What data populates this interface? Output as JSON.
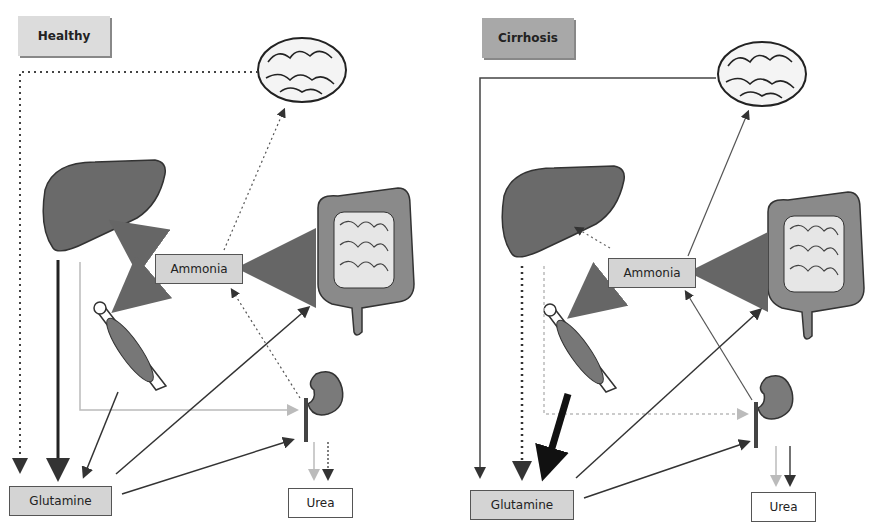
{
  "panels": {
    "healthy": {
      "title": "Healthy",
      "title_color": "#dcdcdc",
      "nodes": {
        "ammonia": "Ammonia",
        "glutamine": "Glutamine",
        "urea": "Urea"
      },
      "organs": [
        "brain",
        "liver",
        "intestine",
        "muscle",
        "kidney"
      ]
    },
    "cirrhosis": {
      "title": "Cirrhosis",
      "title_color": "#a8a8a8",
      "nodes": {
        "ammonia": "Ammonia",
        "glutamine": "Glutamine",
        "urea": "Urea"
      },
      "organs": [
        "brain",
        "liver",
        "intestine",
        "muscle",
        "kidney"
      ]
    }
  },
  "colors": {
    "organ_fill": "#6a6a6a",
    "arrow_dark": "#333333",
    "arrow_light": "#bdbdbd",
    "box_fill": "#d4d4d4"
  }
}
